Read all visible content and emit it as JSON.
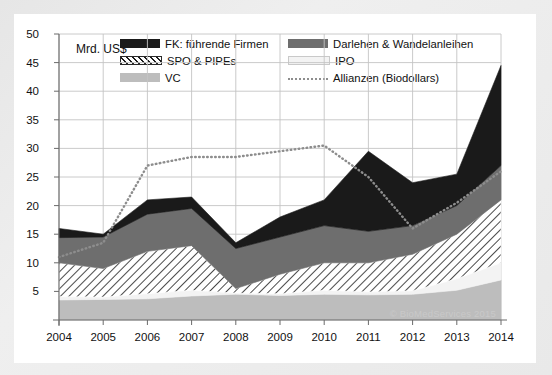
{
  "axis_unit": "Mrd. US$",
  "watermark": "© BioMedServices 2015",
  "legend": {
    "items": [
      {
        "label": "FK: führende Firmen",
        "swatch": "solid-dark-swatch-icon",
        "color": "#1a1a1a"
      },
      {
        "label": "Darlehen & Wandelanleihen",
        "swatch": "solid-gray-swatch-icon",
        "color": "#6e6e6e"
      },
      {
        "label": "SPO & PIPEs",
        "swatch": "hatched-swatch-icon",
        "color": "#ffffff"
      },
      {
        "label": "IPO",
        "swatch": "light-swatch-icon",
        "color": "#f3f3f3"
      },
      {
        "label": "VC",
        "swatch": "mid-light-swatch-icon",
        "color": "#bdbdbd"
      },
      {
        "label": "Allianzen (Biodollars)",
        "swatch": "dotted-line-swatch-icon",
        "color": "#8d8d8d"
      }
    ]
  },
  "chart_data": {
    "type": "area",
    "title": "",
    "subtitle": "",
    "xlabel": "",
    "ylabel": "Mrd. US$",
    "xlim": [
      2004,
      2014
    ],
    "ylim": [
      0,
      50
    ],
    "ytick_step": 5,
    "grid": true,
    "legend_position": "top-inside",
    "stacked": true,
    "categories": [
      2004,
      2005,
      2006,
      2007,
      2008,
      2009,
      2010,
      2011,
      2012,
      2013,
      2014
    ],
    "tick_labels_x": [
      "2004",
      "2005",
      "2006",
      "2007",
      "2008",
      "2009",
      "2010",
      "2011",
      "2012",
      "2013",
      "2014"
    ],
    "tick_labels_y": [
      "5",
      "10",
      "15",
      "20",
      "25",
      "30",
      "35",
      "40",
      "45",
      "50"
    ],
    "series": [
      {
        "name": "VC",
        "stack_order": 1,
        "fill": "#bdbdbd",
        "values": [
          3.5,
          3.6,
          3.7,
          4.2,
          4.5,
          4.3,
          4.5,
          4.4,
          4.5,
          5.2,
          7.0
        ]
      },
      {
        "name": "IPO",
        "stack_order": 2,
        "fill": "#f3f3f3",
        "values": [
          0.6,
          0.4,
          0.9,
          1.0,
          0.2,
          0.3,
          0.7,
          0.5,
          0.6,
          2.0,
          3.0
        ]
      },
      {
        "name": "SPO & PIPEs",
        "stack_order": 3,
        "fill": "#ffffff",
        "values": [
          5.9,
          5.0,
          7.4,
          7.8,
          0.8,
          3.4,
          4.8,
          5.1,
          6.4,
          7.8,
          11.0
        ]
      },
      {
        "name": "Darlehen & Wandelanleihen",
        "stack_order": 4,
        "fill": "#6e6e6e",
        "values": [
          4.4,
          5.5,
          6.5,
          6.5,
          7.0,
          6.5,
          6.5,
          5.5,
          5.0,
          5.0,
          6.0
        ]
      },
      {
        "name": "FK: führende Firmen",
        "stack_order": 5,
        "fill": "#1a1a1a",
        "values": [
          1.6,
          0.5,
          2.5,
          2.0,
          1.0,
          3.5,
          4.5,
          14.0,
          7.5,
          5.5,
          17.5
        ]
      }
    ],
    "stack_totals": [
      16.0,
      15.0,
      21.0,
      21.5,
      13.5,
      18.0,
      21.0,
      29.5,
      24.0,
      25.5,
      44.5
    ],
    "line_series": {
      "name": "Allianzen (Biodollars)",
      "style": "dotted",
      "color": "#8d8d8d",
      "values": [
        11.0,
        13.5,
        27.0,
        28.5,
        28.5,
        29.5,
        30.5,
        25.0,
        16.0,
        20.5,
        26.0
      ]
    }
  }
}
